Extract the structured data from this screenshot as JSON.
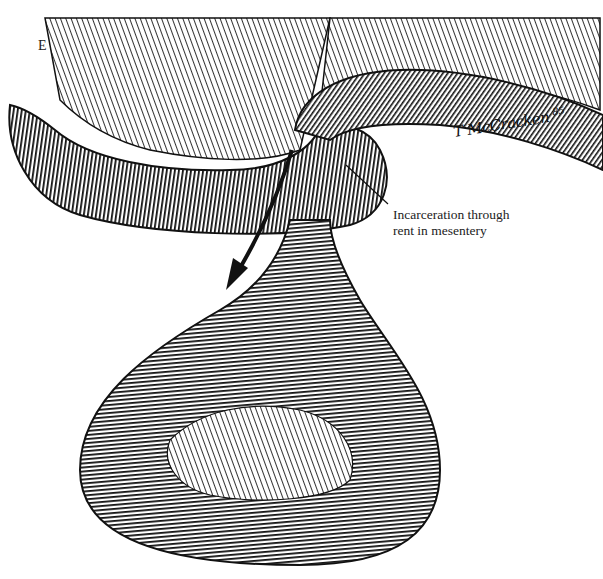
{
  "figure": {
    "panel_label": "E",
    "callout": {
      "line1": "Incarceration through",
      "line2": "rent in mesentery"
    },
    "signature": {
      "name": "T McCracken",
      "year": "85"
    },
    "icons": {
      "direction_arrow": "down-left-arrow"
    },
    "colors": {
      "ink": "#111111",
      "background": "#ffffff"
    }
  }
}
